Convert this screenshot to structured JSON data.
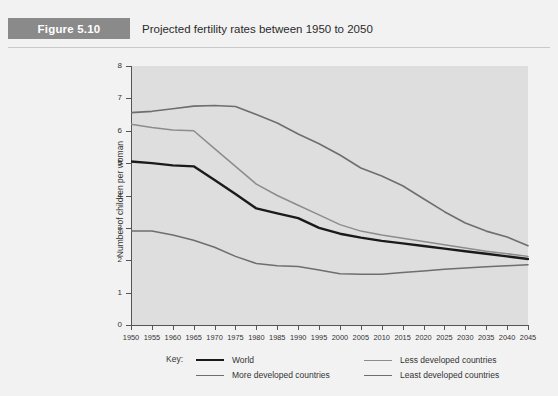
{
  "header": {
    "figure_badge": "Figure 5.10",
    "title": "Projected fertility rates between 1950 to 2050"
  },
  "chart_data": {
    "type": "line",
    "title": "Projected fertility rates between 1950 to 2050",
    "xlabel": "",
    "ylabel": "Number of children per woman",
    "xlim": [
      1950,
      2045
    ],
    "ylim": [
      0,
      8
    ],
    "ytick_labels": [
      "0",
      "1",
      "2",
      "3",
      "4",
      "5",
      "6",
      "7",
      "8"
    ],
    "yticks": [
      0,
      1,
      2,
      3,
      4,
      5,
      6,
      7,
      8
    ],
    "grid": false,
    "legend_position": "bottom",
    "legend_title": "Key:",
    "x": [
      1950,
      1955,
      1960,
      1965,
      1970,
      1975,
      1980,
      1985,
      1990,
      1995,
      2000,
      2005,
      2010,
      2015,
      2020,
      2025,
      2030,
      2035,
      2040,
      2045
    ],
    "series": [
      {
        "name": "World",
        "color": "#1a1a1a",
        "width": 2.4,
        "values": [
          5.05,
          5.0,
          4.93,
          4.9,
          4.48,
          4.05,
          3.6,
          3.45,
          3.3,
          3.0,
          2.82,
          2.7,
          2.6,
          2.52,
          2.44,
          2.36,
          2.28,
          2.2,
          2.12,
          2.04
        ]
      },
      {
        "name": "More developed countries",
        "color": "#6e6e6e",
        "width": 1.5,
        "values": [
          2.9,
          2.9,
          2.78,
          2.62,
          2.4,
          2.12,
          1.9,
          1.83,
          1.81,
          1.7,
          1.58,
          1.57,
          1.57,
          1.62,
          1.67,
          1.72,
          1.76,
          1.8,
          1.83,
          1.86
        ]
      },
      {
        "name": "Less developed countries",
        "color": "#8c8c8c",
        "width": 1.5,
        "values": [
          6.2,
          6.1,
          6.02,
          6.0,
          5.45,
          4.9,
          4.35,
          4.0,
          3.7,
          3.4,
          3.1,
          2.9,
          2.78,
          2.68,
          2.58,
          2.48,
          2.38,
          2.28,
          2.2,
          2.12
        ]
      },
      {
        "name": "Least developed countries",
        "color": "#6e6e6e",
        "width": 1.6,
        "values": [
          6.56,
          6.6,
          6.68,
          6.76,
          6.78,
          6.75,
          6.5,
          6.24,
          5.9,
          5.6,
          5.25,
          4.85,
          4.6,
          4.3,
          3.9,
          3.5,
          3.15,
          2.9,
          2.72,
          2.45
        ]
      }
    ]
  },
  "legend": {
    "label": "Key:",
    "items": [
      {
        "name": "World",
        "color": "#1a1a1a",
        "width": 2.4
      },
      {
        "name": "Less developed countries",
        "color": "#8c8c8c",
        "width": 1.5
      },
      {
        "name": "More developed countries",
        "color": "#6e6e6e",
        "width": 1.5
      },
      {
        "name": "Least developed countries",
        "color": "#6e6e6e",
        "width": 1.6
      }
    ]
  }
}
